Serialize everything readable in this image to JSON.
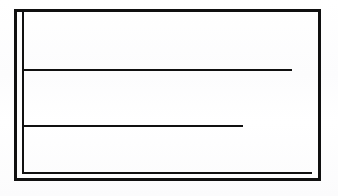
{
  "document": {
    "kind": "scanned-line-drawing",
    "description": "Empty rectangular form frame with two horizontal rules",
    "background_color": "#fdfdfd",
    "ink_color": "#101010",
    "text_content": "",
    "width": 338,
    "height": 196
  },
  "frame": {
    "name": "outer-rectangle",
    "stroke_color": "#101010",
    "stroke_width": 3,
    "left": 14,
    "top": 9,
    "right": 321,
    "bottom": 181,
    "edges": [
      {
        "name": "top-edge",
        "orientation": "horizontal",
        "x": 14,
        "y": 9,
        "length": 307
      },
      {
        "name": "left-edge",
        "orientation": "vertical",
        "x": 14,
        "y": 9,
        "length": 172
      },
      {
        "name": "right-edge",
        "orientation": "vertical",
        "x": 318,
        "y": 9,
        "length": 172
      },
      {
        "name": "bottom-edge",
        "orientation": "horizontal",
        "x": 14,
        "y": 178,
        "length": 307
      }
    ]
  },
  "inner_margin_rule": {
    "name": "inner-L-rule",
    "shape": "L",
    "stroke_color": "#101010",
    "stroke_width": 2,
    "segments": [
      {
        "name": "inner-vertical-rule",
        "orientation": "vertical",
        "x": 22,
        "y": 12,
        "length": 162
      },
      {
        "name": "inner-bottom-rule",
        "orientation": "horizontal",
        "x": 22,
        "y": 172,
        "length": 290
      }
    ]
  },
  "horizontal_rules": [
    {
      "name": "upper-rule",
      "orientation": "horizontal",
      "stroke_color": "#101010",
      "stroke_width": 2,
      "x_start": 22,
      "x_end": 292,
      "y": 69,
      "length": 270,
      "touches_right_border": false
    },
    {
      "name": "lower-rule",
      "orientation": "horizontal",
      "stroke_color": "#101010",
      "stroke_width": 2,
      "x_start": 22,
      "x_end": 243,
      "y": 125,
      "length": 221,
      "touches_right_border": false
    }
  ],
  "regions": [
    {
      "name": "region-top",
      "label": ""
    },
    {
      "name": "region-middle",
      "label": ""
    },
    {
      "name": "region-bottom",
      "label": ""
    }
  ]
}
